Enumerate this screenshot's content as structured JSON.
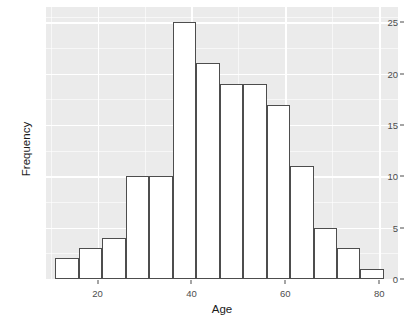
{
  "chart_data": {
    "type": "bar",
    "title": "",
    "subtitle": "",
    "xlabel": "Age",
    "ylabel": "Frequency",
    "categories": [
      "11-16",
      "16-21",
      "21-26",
      "26-31",
      "31-36",
      "36-41",
      "41-46",
      "46-51",
      "51-56",
      "56-61",
      "61-66",
      "66-71",
      "71-76",
      "76-81"
    ],
    "bin_starts": [
      11,
      16,
      21,
      26,
      31,
      36,
      41,
      46,
      51,
      56,
      61,
      66,
      71,
      76
    ],
    "bin_width": 5,
    "values": [
      2,
      3,
      4,
      10,
      10,
      25,
      21,
      19,
      19,
      17,
      11,
      5,
      3,
      1
    ],
    "xlim": [
      9,
      84
    ],
    "ylim": [
      0,
      26.5
    ],
    "x_ticks": [
      20,
      40,
      60,
      80
    ],
    "x_tick_labels": [
      "20",
      "40",
      "60",
      "80"
    ],
    "y_ticks": [
      0,
      5,
      10,
      15,
      20,
      25
    ],
    "y_tick_labels": [
      "0",
      "5",
      "10",
      "15",
      "20",
      "25"
    ],
    "y_minor_ticks": [
      2.5,
      7.5,
      12.5,
      17.5,
      22.5,
      25.5
    ],
    "x_minor_ticks": [
      10,
      30,
      50,
      70
    ],
    "grid": true,
    "legend": "none",
    "colors": {
      "panel_background": "#ebebeb",
      "gridline": "#ffffff",
      "bar_fill": "#ffffff",
      "bar_outline": "#4d4d4d",
      "axis_text": "#4d4d4d",
      "axis_title": "#1a1a1a",
      "plot_background": "#ffffff"
    }
  }
}
